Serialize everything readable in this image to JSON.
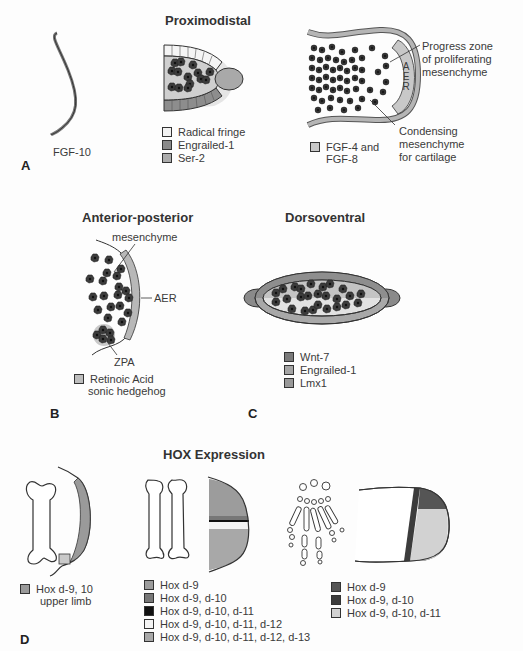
{
  "panels": {
    "A": {
      "letter": "A",
      "title": "Proximodistal",
      "fgf10_label": "FGF-10",
      "legend_mid": [
        {
          "label": "Radical fringe",
          "color": "#f2f2f2"
        },
        {
          "label": "Engrailed-1",
          "color": "#8a8a8a"
        },
        {
          "label": "Ser-2",
          "color": "#ababab"
        }
      ],
      "callouts": {
        "progress_zone": [
          "Progress zone",
          "of proliferating",
          "mesenchyme"
        ],
        "condensing": [
          "Condensing",
          "mesenchyme",
          "for cartilage"
        ],
        "aer": "AER"
      },
      "legend_right": [
        {
          "label_lines": [
            "FGF-4 and",
            "FGF-8"
          ],
          "color": "#c8c8c8"
        }
      ]
    },
    "B": {
      "letter": "B",
      "title": "Anterior-posterior",
      "callouts": {
        "mesenchyme": "mesenchyme",
        "aer": "AER",
        "zpa": "ZPA"
      },
      "legend": [
        {
          "label_lines": [
            "Retinoic Acid",
            "sonic hedgehog"
          ],
          "color": "#bdbdbd"
        }
      ]
    },
    "C": {
      "letter": "C",
      "title": "Dorsoventral",
      "legend": [
        {
          "label": "Wnt-7",
          "color": "#7a7a7a"
        },
        {
          "label": "Engrailed-1",
          "color": "#a5a5a5"
        },
        {
          "label": "Lmx1",
          "color": "#999999"
        }
      ]
    },
    "D": {
      "letter": "D",
      "title": "HOX Expression",
      "legend_left": [
        {
          "label_lines": [
            "Hox d-9, 10",
            "upper limb"
          ],
          "color": "#9a9a9a"
        }
      ],
      "legend_mid": [
        {
          "label": "Hox d-9",
          "color": "#9c9c9c"
        },
        {
          "label": "Hox d-9, d-10",
          "color": "#777777"
        },
        {
          "label": "Hox d-9, d-10, d-11",
          "color": "#111111"
        },
        {
          "label": "Hox d-9, d-10, d-11, d-12",
          "color": "#f4f4f4"
        },
        {
          "label": "Hox d-9, d-10, d-11, d-12, d-13",
          "color": "#a8a8a8"
        }
      ],
      "legend_right": [
        {
          "label": "Hox d-9",
          "color": "#555555"
        },
        {
          "label": "Hox d-9, d-10",
          "color": "#3c3c3c"
        },
        {
          "label": "Hox d-9, d-10, d-11",
          "color": "#d2d2d2"
        }
      ]
    }
  }
}
